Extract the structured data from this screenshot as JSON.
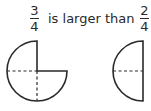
{
  "statement": {
    "left_fraction": {
      "numerator": "3",
      "denominator": "4"
    },
    "phrase": "is larger than",
    "right_fraction": {
      "numerator": "2",
      "denominator": "4"
    }
  },
  "figures": [
    {
      "name": "three-quarters-circle",
      "fraction": "3/4",
      "shaded_parts": 3,
      "total_parts": 4
    },
    {
      "name": "half-circle",
      "fraction": "2/4",
      "shaded_parts": 2,
      "total_parts": 4
    }
  ],
  "colors": {
    "stroke": "#2a2a2a",
    "background": "#ffffff"
  }
}
